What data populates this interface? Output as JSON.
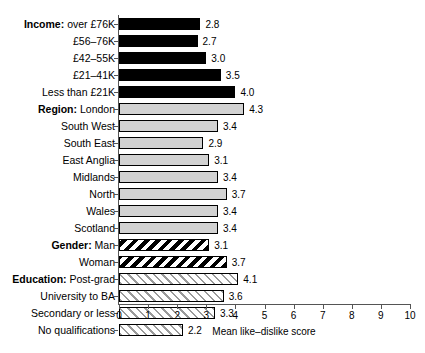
{
  "chart_data": {
    "type": "bar",
    "orientation": "horizontal",
    "title": "",
    "xlabel": "Mean like–dislike score",
    "ylabel": "",
    "xlim": [
      0,
      10
    ],
    "xticks": [
      "0",
      "1",
      "2",
      "3",
      "4",
      "5",
      "6",
      "7",
      "8",
      "9",
      "10"
    ],
    "grid": false,
    "legend": "none",
    "groups": [
      {
        "name": "Income",
        "style": "solid-black",
        "categories": [
          "over £76K",
          "£56–76K",
          "£42–55K",
          "£21–41K",
          "Less than £21K"
        ],
        "values": [
          2.8,
          2.7,
          3.0,
          3.5,
          4.0
        ]
      },
      {
        "name": "Region",
        "style": "light-gray",
        "categories": [
          "London",
          "South West",
          "South East",
          "East Anglia",
          "Midlands",
          "North",
          "Wales",
          "Scotland"
        ],
        "values": [
          4.3,
          3.4,
          2.9,
          3.1,
          3.4,
          3.7,
          3.4,
          3.4
        ]
      },
      {
        "name": "Gender",
        "style": "hatch-black",
        "categories": [
          "Man",
          "Woman"
        ],
        "values": [
          3.1,
          3.7
        ]
      },
      {
        "name": "Education",
        "style": "hatch-gray",
        "categories": [
          "Post-grad",
          "University to BA",
          "Secondary or less",
          "No qualifications"
        ],
        "values": [
          4.1,
          3.6,
          3.3,
          2.2
        ]
      }
    ],
    "rows": [
      {
        "group": "Income",
        "group_prefix": "Income",
        "label": "over £76K",
        "value": 2.8,
        "value_label": "2.8",
        "style": "solid-black"
      },
      {
        "group": "Income",
        "group_prefix": "",
        "label": "£56–76K",
        "value": 2.7,
        "value_label": "2.7",
        "style": "solid-black"
      },
      {
        "group": "Income",
        "group_prefix": "",
        "label": "£42–55K",
        "value": 3.0,
        "value_label": "3.0",
        "style": "solid-black"
      },
      {
        "group": "Income",
        "group_prefix": "",
        "label": "£21–41K",
        "value": 3.5,
        "value_label": "3.5",
        "style": "solid-black"
      },
      {
        "group": "Income",
        "group_prefix": "",
        "label": "Less than £21K",
        "value": 4.0,
        "value_label": "4.0",
        "style": "solid-black"
      },
      {
        "group": "Region",
        "group_prefix": "Region",
        "label": "London",
        "value": 4.3,
        "value_label": "4.3",
        "style": "light-gray"
      },
      {
        "group": "Region",
        "group_prefix": "",
        "label": "South West",
        "value": 3.4,
        "value_label": "3.4",
        "style": "light-gray"
      },
      {
        "group": "Region",
        "group_prefix": "",
        "label": "South East",
        "value": 2.9,
        "value_label": "2.9",
        "style": "light-gray"
      },
      {
        "group": "Region",
        "group_prefix": "",
        "label": "East Anglia",
        "value": 3.1,
        "value_label": "3.1",
        "style": "light-gray"
      },
      {
        "group": "Region",
        "group_prefix": "",
        "label": "Midlands",
        "value": 3.4,
        "value_label": "3.4",
        "style": "light-gray"
      },
      {
        "group": "Region",
        "group_prefix": "",
        "label": "North",
        "value": 3.7,
        "value_label": "3.7",
        "style": "light-gray"
      },
      {
        "group": "Region",
        "group_prefix": "",
        "label": "Wales",
        "value": 3.4,
        "value_label": "3.4",
        "style": "light-gray"
      },
      {
        "group": "Region",
        "group_prefix": "",
        "label": "Scotland",
        "value": 3.4,
        "value_label": "3.4",
        "style": "light-gray"
      },
      {
        "group": "Gender",
        "group_prefix": "Gender",
        "label": "Man",
        "value": 3.1,
        "value_label": "3.1",
        "style": "hatch-black"
      },
      {
        "group": "Gender",
        "group_prefix": "",
        "label": "Woman",
        "value": 3.7,
        "value_label": "3.7",
        "style": "hatch-black"
      },
      {
        "group": "Education",
        "group_prefix": "Education",
        "label": "Post-grad",
        "value": 4.1,
        "value_label": "4.1",
        "style": "hatch-gray"
      },
      {
        "group": "Education",
        "group_prefix": "",
        "label": "University to BA",
        "value": 3.6,
        "value_label": "3.6",
        "style": "hatch-gray"
      },
      {
        "group": "Education",
        "group_prefix": "",
        "label": "Secondary or less",
        "value": 3.3,
        "value_label": "3.3",
        "style": "hatch-gray"
      },
      {
        "group": "Education",
        "group_prefix": "",
        "label": "No qualifications",
        "value": 2.2,
        "value_label": "2.2",
        "style": "hatch-gray"
      }
    ]
  }
}
